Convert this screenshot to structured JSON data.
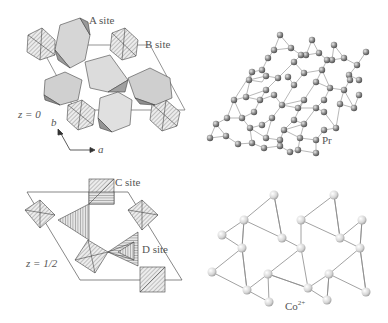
{
  "figure": {
    "panels": [
      {
        "id": "top-left",
        "description": "Polyhedral structure at z = 0",
        "labels": {
          "site_a": "A site",
          "site_b": "B site",
          "z_level": "z = 0",
          "axis_b": "b",
          "axis_a": "a"
        }
      },
      {
        "id": "top-right",
        "description": "Pr atom network",
        "labels": {
          "atom": "Pr"
        }
      },
      {
        "id": "bottom-left",
        "description": "Polyhedral structure at z = 1/2",
        "labels": {
          "site_c": "C site",
          "site_d": "D site",
          "z_level": "z = 1/2"
        }
      },
      {
        "id": "bottom-right",
        "description": "Co2+ atom network",
        "labels": {
          "atom_base": "Co",
          "atom_charge": "2+"
        }
      }
    ],
    "colors": {
      "polyhedron_light": "#d9d9d9",
      "polyhedron_mid": "#b8b8b8",
      "polyhedron_dark": "#8f8f8f",
      "hatch_fill": "#e4e4e4",
      "line": "#444444",
      "pr_atom": "#8a8a8a",
      "co_atom": "#d4d4d4"
    }
  }
}
